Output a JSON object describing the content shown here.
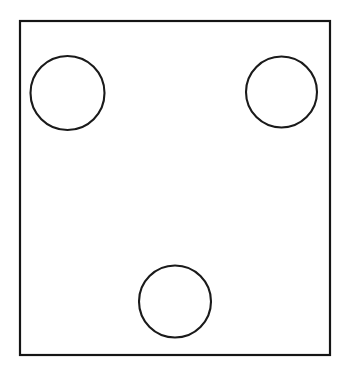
{
  "canvas": {
    "width": 348,
    "height": 383,
    "background_color": "#ffffff",
    "description": "Black line drawing of a tall rectangle containing three circles"
  },
  "figure": {
    "stroke_color": "#151515",
    "fill_color": "#ffffff",
    "frame": {
      "name": "rectangle-outline",
      "shape": "rectangle",
      "x": 20,
      "y": 21,
      "width": 310,
      "height": 334,
      "stroke_width": 2.2,
      "stroke_color": "#151515",
      "fill_color": "#ffffff"
    },
    "circles": [
      {
        "name": "circle-top-left",
        "label": "top-left circle",
        "cx": 67.5,
        "cy": 93,
        "r": 37,
        "diameter": 74,
        "stroke_width": 2.1,
        "stroke_color": "#1a1a1a",
        "fill_color": "#ffffff"
      },
      {
        "name": "circle-top-right",
        "label": "top-right circle",
        "cx": 281.5,
        "cy": 92,
        "r": 35.5,
        "diameter": 71,
        "stroke_width": 2.1,
        "stroke_color": "#1a1a1a",
        "fill_color": "#ffffff"
      },
      {
        "name": "circle-bottom-center",
        "label": "bottom-center circle",
        "cx": 175,
        "cy": 301.5,
        "r": 36,
        "diameter": 72,
        "stroke_width": 2.1,
        "stroke_color": "#1a1a1a",
        "fill_color": "#ffffff"
      }
    ],
    "circle_count": 3
  }
}
